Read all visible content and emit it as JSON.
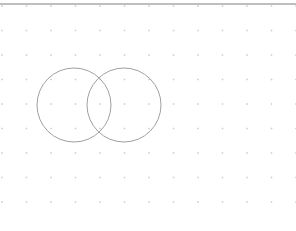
{
  "canvas": {
    "width": 296,
    "height": 231,
    "background": "#ffffff"
  },
  "top_border": {
    "y": 4,
    "color": "#a8a8a8",
    "stroke_width": 1.5
  },
  "grid": {
    "style": "dot",
    "dot_color": "#d0d0d0",
    "origin_x": 2,
    "origin_y": 6,
    "spacing_x": 24.5,
    "spacing_y": 24.5,
    "columns": 13,
    "rows": 9
  },
  "shapes": [
    {
      "type": "circle",
      "name": "left-circle",
      "cx": 74,
      "cy": 105,
      "r": 37,
      "stroke": "#a0a0a0",
      "stroke_width": 1,
      "fill": "none"
    },
    {
      "type": "circle",
      "name": "right-circle",
      "cx": 124,
      "cy": 105,
      "r": 37,
      "stroke": "#a0a0a0",
      "stroke_width": 1,
      "fill": "none"
    }
  ]
}
